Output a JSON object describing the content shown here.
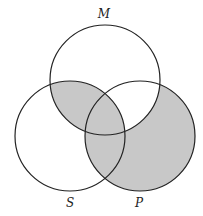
{
  "diagram": {
    "type": "venn-3",
    "circles": [
      {
        "id": "M",
        "label": "M",
        "cx": 105,
        "cy": 80,
        "r": 55,
        "label_x": 104,
        "label_y": 18
      },
      {
        "id": "S",
        "label": "S",
        "cx": 70,
        "cy": 136,
        "r": 55,
        "label_x": 70,
        "label_y": 207
      },
      {
        "id": "P",
        "label": "P",
        "cx": 140,
        "cy": 136,
        "r": 55,
        "label_x": 139,
        "label_y": 207
      }
    ],
    "shaded_regions": [
      "M∩S∖P",
      "M∩S∩P",
      "S∩P∖M",
      "P∖(M∪S)"
    ],
    "unshaded_regions": [
      "M∖(S∪P)",
      "S∖(M∪P)",
      "M∩P∖S"
    ],
    "colors": {
      "shade": "#c8c8c8",
      "stroke": "#222222",
      "background": "#ffffff"
    }
  }
}
